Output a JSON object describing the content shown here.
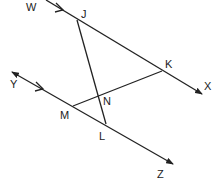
{
  "diagram": {
    "type": "geometry",
    "colors": {
      "stroke": "#222222",
      "background": "#ffffff"
    },
    "labels": {
      "W": "W",
      "J": "J",
      "K": "K",
      "X": "X",
      "Y": "Y",
      "N": "N",
      "M": "M",
      "L": "L",
      "Z": "Z"
    },
    "points": {
      "J": [
        77,
        20
      ],
      "K": [
        162,
        71
      ],
      "M": [
        73,
        106
      ],
      "L": [
        106,
        124
      ],
      "N": [
        98,
        96
      ]
    },
    "lines": [
      {
        "name": "line-WX",
        "from": [
          46,
          0
        ],
        "to": [
          202,
          94
        ],
        "arrow_end": true,
        "parallel_marker": [
          60,
          9
        ]
      },
      {
        "name": "line-YZ",
        "from": [
          12,
          72
        ],
        "to": [
          173,
          164
        ],
        "arrow_start": true,
        "arrow_end": true,
        "parallel_marker": [
          40,
          88
        ]
      },
      {
        "name": "segment-JL",
        "from": [
          77,
          20
        ],
        "to": [
          106,
          124
        ]
      },
      {
        "name": "segment-MK",
        "from": [
          73,
          106
        ],
        "to": [
          162,
          71
        ]
      }
    ],
    "parallel": [
      [
        "WX",
        "YZ"
      ]
    ]
  }
}
